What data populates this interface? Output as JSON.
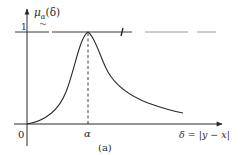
{
  "figure": {
    "caption": "(a)",
    "y_axis_label": "μ",
    "y_axis_label_sub": "α",
    "y_axis_label_arg": "(δ)",
    "y_tick_1": "1",
    "origin_label": "0",
    "x_tick_alpha": "α",
    "x_axis_label": "δ = |y − x|"
  },
  "colors": {
    "stroke": "#2a2a2a",
    "faint": "#9a9a9a"
  },
  "curve": {
    "description": "Membership function rising from 0 at origin to peak 1 at δ = α, then decaying toward 0",
    "peak_x_label": "α",
    "peak_value": 1
  }
}
